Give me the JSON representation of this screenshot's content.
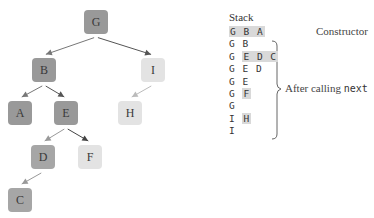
{
  "tree": {
    "nodes": [
      {
        "id": "G",
        "label": "G",
        "x": 84,
        "y": 10,
        "color": "#999999"
      },
      {
        "id": "B",
        "label": "B",
        "x": 32,
        "y": 58,
        "color": "#999999"
      },
      {
        "id": "I",
        "label": "I",
        "x": 141,
        "y": 58,
        "color": "#e3e3e3"
      },
      {
        "id": "A",
        "label": "A",
        "x": 8,
        "y": 101,
        "color": "#999999"
      },
      {
        "id": "E",
        "label": "E",
        "x": 54,
        "y": 101,
        "color": "#999999"
      },
      {
        "id": "H",
        "label": "H",
        "x": 118,
        "y": 101,
        "color": "#e3e3e3"
      },
      {
        "id": "D",
        "label": "D",
        "x": 31,
        "y": 145,
        "color": "#a6a6a6"
      },
      {
        "id": "F",
        "label": "F",
        "x": 78,
        "y": 145,
        "color": "#e3e3e3"
      },
      {
        "id": "C",
        "label": "C",
        "x": 8,
        "y": 188,
        "color": "#a6a6a6"
      }
    ],
    "edges": [
      {
        "from": "G",
        "to": "B",
        "color": "#777777"
      },
      {
        "from": "G",
        "to": "I",
        "color": "#555555"
      },
      {
        "from": "B",
        "to": "A",
        "color": "#777777"
      },
      {
        "from": "B",
        "to": "E",
        "color": "#555555"
      },
      {
        "from": "I",
        "to": "H",
        "color": "#bbbbbb"
      },
      {
        "from": "E",
        "to": "D",
        "color": "#999999"
      },
      {
        "from": "E",
        "to": "F",
        "color": "#444444"
      },
      {
        "from": "D",
        "to": "C",
        "color": "#999999"
      }
    ]
  },
  "stack": {
    "title": "Stack",
    "rows": [
      {
        "plain": "",
        "highlight": "G B A"
      },
      {
        "plain": "G B",
        "highlight": ""
      },
      {
        "plain": "G ",
        "highlight": "E D C"
      },
      {
        "plain": "G E D",
        "highlight": ""
      },
      {
        "plain": "G E",
        "highlight": ""
      },
      {
        "plain": "G ",
        "highlight": "F"
      },
      {
        "plain": "G",
        "highlight": ""
      },
      {
        "plain": "I ",
        "highlight": "H"
      },
      {
        "plain": "I",
        "highlight": ""
      }
    ]
  },
  "annotations": {
    "constructor_label": "Constructor",
    "after_calling_label": "After calling ",
    "after_calling_code": "next"
  }
}
